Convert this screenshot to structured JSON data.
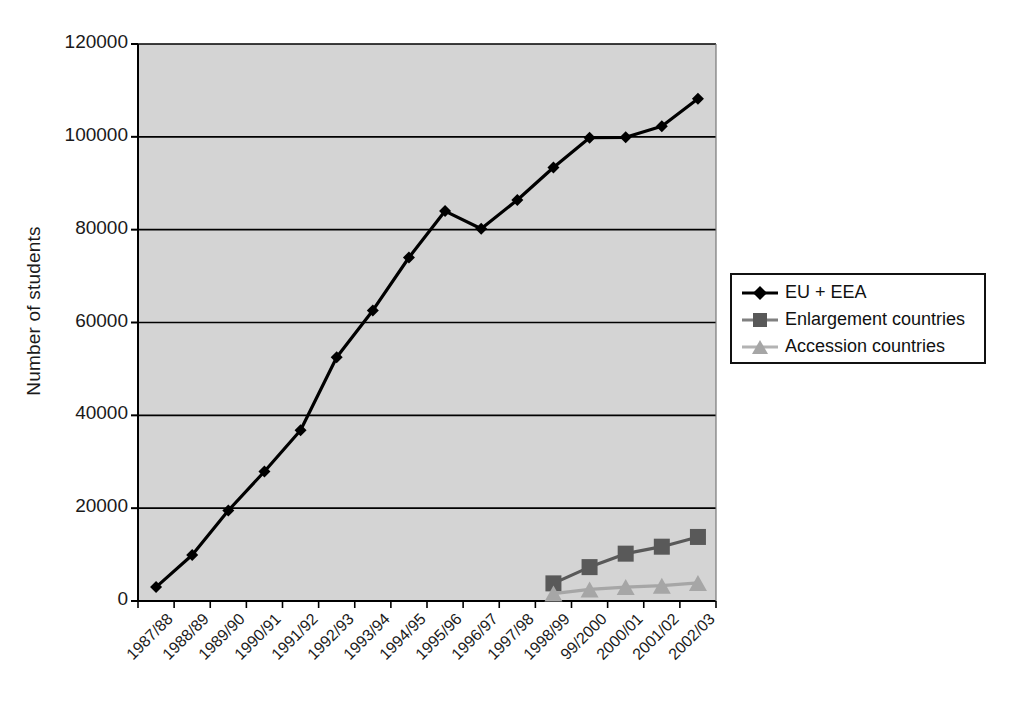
{
  "chart_data": {
    "type": "line",
    "title": "",
    "xlabel": "",
    "ylabel": "Number of students",
    "ylim": [
      0,
      120000
    ],
    "ytick_labels": [
      "0",
      "20000",
      "40000",
      "60000",
      "80000",
      "100000",
      "120000"
    ],
    "ytick_values": [
      0,
      20000,
      40000,
      60000,
      80000,
      100000,
      120000
    ],
    "grid": true,
    "grid_axis": "y",
    "legend_position": "right",
    "plot_background": "#d4d4d4",
    "categories": [
      "1987/88",
      "1988/89",
      "1989/90",
      "1990/91",
      "1991/92",
      "1992/93",
      "1993/94",
      "1994/95",
      "1995/96",
      "1996/97",
      "1997/98",
      "1998/99",
      "99/2000",
      "2000/01",
      "2001/02",
      "2002/03"
    ],
    "series": [
      {
        "name": "EU + EEA",
        "color": "#000000",
        "marker": "diamond",
        "values": [
          3000,
          9900,
          19500,
          27900,
          36800,
          52500,
          62600,
          74000,
          84000,
          80200,
          86400,
          93400,
          99800,
          99900,
          102300,
          108200
        ]
      },
      {
        "name": "Enlargement countries",
        "color": "#595959",
        "marker": "square",
        "values": [
          null,
          null,
          null,
          null,
          null,
          null,
          null,
          null,
          null,
          null,
          null,
          3800,
          7300,
          10200,
          11700,
          13800
        ]
      },
      {
        "name": "Accession countries",
        "color": "#a6a6a6",
        "marker": "triangle",
        "values": [
          null,
          null,
          null,
          null,
          null,
          null,
          null,
          null,
          null,
          null,
          null,
          1600,
          2500,
          3000,
          3300,
          3900
        ]
      }
    ]
  },
  "legend": {
    "items": [
      {
        "label": "EU + EEA"
      },
      {
        "label": "Enlargement countries"
      },
      {
        "label": "Accession countries"
      }
    ]
  }
}
